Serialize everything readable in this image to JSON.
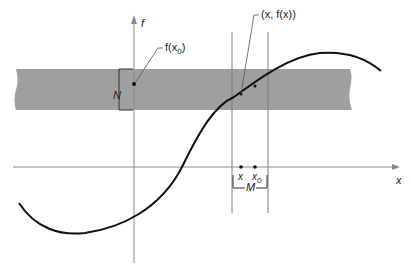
{
  "diagram": {
    "axes": {
      "x_label": "x",
      "y_label": "f"
    },
    "band": {
      "fill": "#9a9a9a",
      "label": "N"
    },
    "interval": {
      "label": "M",
      "points": [
        {
          "name": "x",
          "label": "x"
        },
        {
          "name": "x0",
          "label": "x",
          "subscript": "0"
        }
      ]
    },
    "annotations": {
      "f_x0": {
        "label": "f(x",
        "subscript": "0",
        "suffix": ")"
      },
      "point_on_curve": {
        "label": "(x, f(x))"
      }
    },
    "colors": {
      "curve": "#111111",
      "axis": "#8a8a8a",
      "band": "#9a9a9a",
      "text": "#222222"
    }
  }
}
